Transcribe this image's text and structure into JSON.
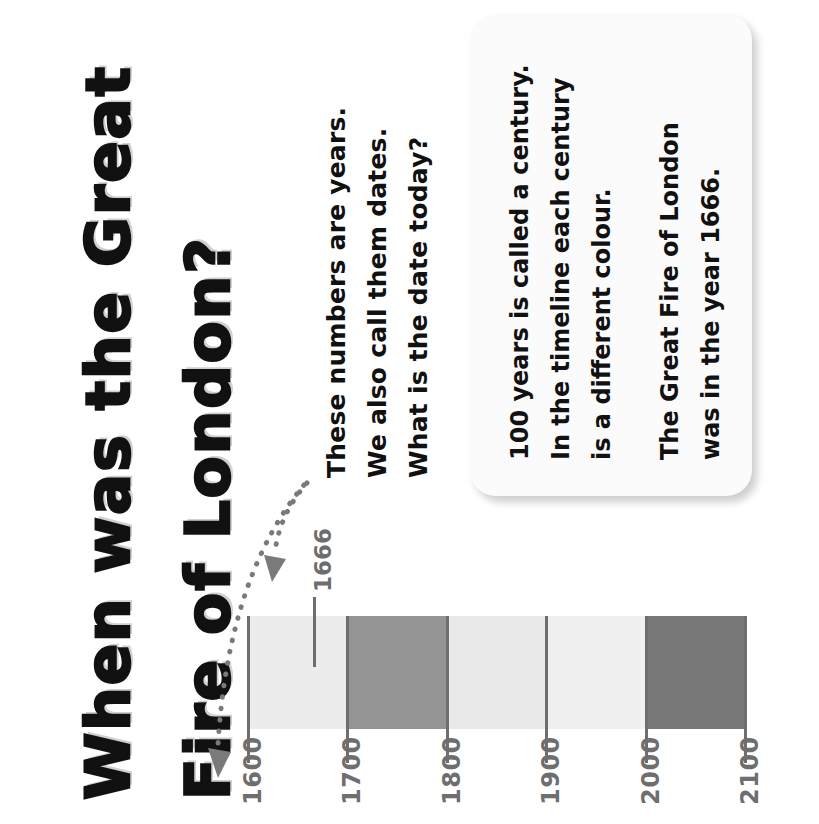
{
  "page": {
    "background_color": "#ffffff",
    "title_lines": [
      "When was the Great",
      "Fire of London?"
    ]
  },
  "note": {
    "lines": [
      "These numbers are years.",
      "We also call them dates.",
      "What is the date today?"
    ]
  },
  "info_card": {
    "background_color": "#fbfbfb",
    "lines": [
      "100 years is called a century.",
      "In the timeline each century",
      "is a different colour.",
      "The Great Fire of London",
      "was in the year 1666."
    ]
  },
  "chart_data": {
    "type": "bar",
    "title": "When was the Great Fire of London?",
    "xlabel": "",
    "ylabel": "",
    "orientation": "horizontal-timeline",
    "axis_range": [
      1600,
      2100
    ],
    "tick_labels": [
      "1600",
      "1700",
      "1800",
      "1900",
      "2000",
      "2100"
    ],
    "tick_values": [
      1600,
      1700,
      1800,
      1900,
      2000,
      2100
    ],
    "grid": false,
    "legend": "none",
    "segments": [
      {
        "label": "1600-1700",
        "start": 1600,
        "end": 1700,
        "color": "#ececec"
      },
      {
        "label": "1700-1800",
        "start": 1700,
        "end": 1800,
        "color": "#949494"
      },
      {
        "label": "1800-1900",
        "start": 1800,
        "end": 1900,
        "color": "#e9e9e9"
      },
      {
        "label": "1900-2000",
        "start": 1900,
        "end": 2000,
        "color": "#efefef"
      },
      {
        "label": "2000-2100",
        "start": 2000,
        "end": 2100,
        "color": "#787878"
      }
    ],
    "annotations": [
      {
        "name": "event-marker",
        "value": 1666,
        "label": "1666",
        "color": "#6e6e6e"
      }
    ],
    "callouts": [
      {
        "name": "arrow-to-1600",
        "target": "1600",
        "style": "dotted-curved-arrow"
      },
      {
        "name": "arrow-to-1666",
        "target": "1666",
        "style": "dotted-curved-arrow"
      }
    ]
  },
  "colors": {
    "ink": "#111111",
    "axis": "#6e6e6e",
    "arrow": "#7a7a7a",
    "century_light": "#ececec",
    "century_mid": "#949494",
    "century_dark": "#787878"
  }
}
